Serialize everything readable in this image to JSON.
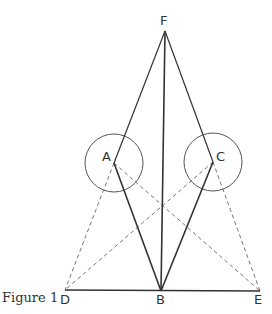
{
  "caption": "Figure 1",
  "points": {
    "A": {
      "label": "A",
      "x": 114,
      "y": 163
    },
    "B": {
      "label": "B",
      "x": 161,
      "y": 291
    },
    "C": {
      "label": "C",
      "x": 213,
      "y": 162
    },
    "D": {
      "label": "D",
      "x": 65,
      "y": 290
    },
    "E": {
      "label": "E",
      "x": 260,
      "y": 291
    },
    "F": {
      "label": "F",
      "x": 165,
      "y": 31
    }
  },
  "circles": [
    {
      "center": "A",
      "r": 29
    },
    {
      "center": "C",
      "r": 29
    }
  ],
  "solid_segments": [
    [
      "F",
      "A"
    ],
    [
      "F",
      "C"
    ],
    [
      "F",
      "B"
    ],
    [
      "A",
      "B"
    ],
    [
      "C",
      "B"
    ],
    [
      "D",
      "E"
    ]
  ],
  "dashed_segments": [
    [
      "A",
      "D"
    ],
    [
      "A",
      "E"
    ],
    [
      "C",
      "D"
    ],
    [
      "C",
      "E"
    ]
  ],
  "colors": {
    "stroke": "#333333",
    "dashed": "#777777",
    "circle": "#555555"
  }
}
